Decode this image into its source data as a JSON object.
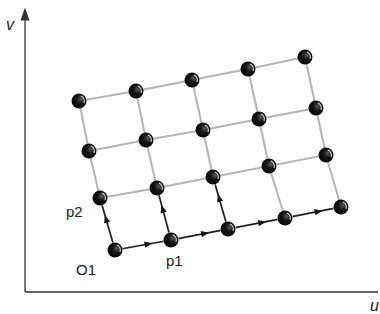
{
  "axes": {
    "x_label": "u",
    "y_label": "v"
  },
  "labels": {
    "origin": "O1",
    "p1": "p1",
    "p2": "p2"
  },
  "colors": {
    "axis": "#333333",
    "grid_line": "#b5b5b5",
    "node": "#141414",
    "node_highlight": "#d8d8d8",
    "arrow": "#1a1a1a"
  },
  "grid": {
    "columns": 5,
    "rows": 4,
    "nodes": [
      [
        [
          115,
          250
        ],
        [
          171,
          240
        ],
        [
          228,
          229
        ],
        [
          285,
          218
        ],
        [
          341,
          207
        ]
      ],
      [
        [
          100,
          198
        ],
        [
          157,
          188
        ],
        [
          213,
          177
        ],
        [
          269,
          166
        ],
        [
          326,
          155
        ]
      ],
      [
        [
          89,
          151
        ],
        [
          146,
          140
        ],
        [
          203,
          130
        ],
        [
          259,
          119
        ],
        [
          316,
          108
        ]
      ],
      [
        [
          79,
          101
        ],
        [
          136,
          91
        ],
        [
          192,
          80
        ],
        [
          248,
          69
        ],
        [
          305,
          57
        ]
      ]
    ]
  },
  "arrows": [
    {
      "from": [
        0,
        0
      ],
      "to": [
        0,
        1
      ],
      "dir": "p1"
    },
    {
      "from": [
        0,
        1
      ],
      "to": [
        0,
        2
      ],
      "dir": "p1"
    },
    {
      "from": [
        0,
        2
      ],
      "to": [
        0,
        3
      ],
      "dir": "p1"
    },
    {
      "from": [
        0,
        3
      ],
      "to": [
        0,
        4
      ],
      "dir": "p1"
    },
    {
      "from": [
        0,
        0
      ],
      "to": [
        1,
        0
      ],
      "dir": "p2"
    },
    {
      "from": [
        0,
        1
      ],
      "to": [
        1,
        1
      ],
      "dir": "p2"
    },
    {
      "from": [
        0,
        2
      ],
      "to": [
        1,
        2
      ],
      "dir": "p2"
    }
  ]
}
